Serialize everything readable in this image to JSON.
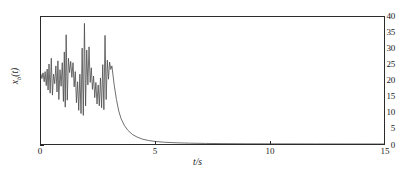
{
  "chart_data": {
    "type": "line",
    "title": "",
    "subtitle": "",
    "xlabel": "t/s",
    "ylabel": "xₑ(t)",
    "ylabel_base": "x",
    "ylabel_sub": "b",
    "ylabel_arg": "(t)",
    "xlim": [
      0,
      15
    ],
    "ylim": [
      0,
      40
    ],
    "xticks": [
      0,
      5,
      10,
      15
    ],
    "xtick_labels": [
      "0",
      "5",
      "10",
      "15"
    ],
    "yticks": [
      0,
      5,
      10,
      15,
      20,
      25,
      30,
      35,
      40
    ],
    "ytick_labels": [
      "0",
      "5",
      "10",
      "15",
      "20",
      "25",
      "30",
      "35",
      "40"
    ],
    "grid": false,
    "legend": false,
    "legend_position": "none",
    "line_color": "#4a4a4a",
    "line_width": 0.8,
    "frame_color": "#2b2b2b",
    "background": "#ffffff",
    "series": [
      {
        "name": "x_b(t)",
        "x": [
          0.0,
          0.04,
          0.09,
          0.14,
          0.18,
          0.23,
          0.27,
          0.31,
          0.35,
          0.4,
          0.45,
          0.5,
          0.55,
          0.6,
          0.65,
          0.7,
          0.74,
          0.78,
          0.83,
          0.88,
          0.93,
          0.98,
          1.02,
          1.06,
          1.1,
          1.15,
          1.2,
          1.25,
          1.3,
          1.35,
          1.4,
          1.45,
          1.5,
          1.55,
          1.6,
          1.65,
          1.7,
          1.75,
          1.8,
          1.85,
          1.9,
          1.95,
          2.0,
          2.05,
          2.1,
          2.15,
          2.2,
          2.25,
          2.3,
          2.35,
          2.4,
          2.45,
          2.5,
          2.55,
          2.6,
          2.65,
          2.7,
          2.75,
          2.8,
          2.85,
          2.9,
          2.95,
          3.0,
          3.05,
          3.1,
          3.2,
          3.3,
          3.4,
          3.5,
          3.65,
          3.8,
          4.0,
          4.2,
          4.45,
          4.7,
          5.0,
          5.4,
          5.9,
          6.5,
          7.2,
          8.0,
          9.0,
          10.5,
          12.0,
          13.5,
          15.0
        ],
        "y": [
          22.0,
          20.6,
          22.4,
          19.6,
          22.8,
          18.4,
          23.6,
          17.0,
          25.2,
          16.0,
          27.0,
          15.4,
          22.0,
          19.0,
          24.6,
          16.4,
          26.2,
          14.0,
          23.4,
          18.2,
          25.6,
          13.4,
          29.0,
          11.6,
          34.4,
          13.8,
          27.0,
          22.5,
          26.0,
          21.0,
          25.6,
          18.0,
          22.8,
          13.0,
          19.6,
          10.6,
          22.0,
          9.6,
          30.2,
          9.0,
          38.0,
          12.0,
          29.6,
          18.6,
          30.6,
          19.4,
          24.0,
          17.2,
          21.4,
          14.6,
          19.4,
          12.6,
          18.6,
          12.0,
          20.8,
          11.4,
          25.0,
          10.8,
          34.2,
          14.0,
          26.4,
          20.4,
          25.8,
          23.5,
          24.6,
          18.6,
          14.0,
          10.4,
          8.0,
          5.8,
          4.3,
          3.0,
          2.2,
          1.5,
          1.1,
          0.8,
          0.55,
          0.38,
          0.26,
          0.18,
          0.12,
          0.08,
          0.05,
          0.03,
          0.02,
          0.01
        ]
      }
    ]
  }
}
